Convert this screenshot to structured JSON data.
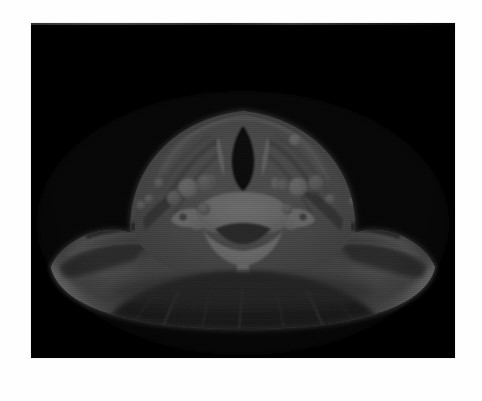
{
  "figure": {
    "type": "medical-image",
    "modality": "CT",
    "panel_label": "B",
    "background_color": "#ffffff"
  },
  "ct_panel": {
    "name": "axial-ct-neck",
    "background_color": "#000000",
    "x": 31,
    "y": 23,
    "width": 424,
    "height": 335,
    "window": "soft-tissue"
  },
  "caption": {
    "panel_letter": "B",
    "badge_color": "#4d4d4d",
    "badge_text_color": "#ffffff",
    "rule_color": "#6e6e6e"
  },
  "anatomy": {
    "structures": [
      {
        "name": "airway-lumen",
        "appearance": "air-density",
        "tone": "#000000"
      },
      {
        "name": "cervical-vertebra",
        "appearance": "bone",
        "tone": "#f2f2f2"
      },
      {
        "name": "spinal-canal",
        "appearance": "soft-tissue",
        "tone": "#4a4a4a"
      },
      {
        "name": "carotid-vessel-left",
        "appearance": "enhanced-vessel",
        "tone": "#e0e0e0"
      },
      {
        "name": "carotid-vessel-right",
        "appearance": "enhanced-vessel",
        "tone": "#e0e0e0"
      },
      {
        "name": "jugular-vein-left",
        "appearance": "enhanced-vessel",
        "tone": "#d8d8d8"
      },
      {
        "name": "jugular-vein-right",
        "appearance": "enhanced-vessel",
        "tone": "#d8d8d8"
      },
      {
        "name": "lymph-nodes",
        "appearance": "round-hyperdense",
        "tone": "#cfcfcf"
      },
      {
        "name": "sternocleidomastoid-muscle",
        "appearance": "muscle",
        "tone": "#909090"
      },
      {
        "name": "shoulder-soft-tissue",
        "appearance": "muscle-fat",
        "tone": "#8a8a8a"
      },
      {
        "name": "subcutaneous-fat",
        "appearance": "fat",
        "tone": "#6a6a6a"
      },
      {
        "name": "posterior-back-tissue",
        "appearance": "low-density",
        "tone": "#1a1a1a"
      }
    ]
  }
}
